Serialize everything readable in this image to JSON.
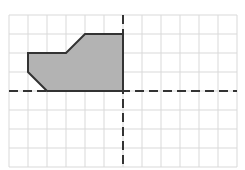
{
  "diagram": {
    "type": "coordinate-grid",
    "grid": {
      "columns": 12,
      "rows": 8,
      "cell_size": 19,
      "origin_px": [
        9,
        15
      ],
      "line_color": "#d9d9d9"
    },
    "axes": {
      "x_axis_row": 4,
      "y_axis_col": 6,
      "style": "dashed",
      "color": "#333333"
    },
    "shape": {
      "name": "shaded-polygon",
      "fill": "#b3b3b3",
      "stroke": "#333333",
      "vertices_grid": [
        [
          4,
          1
        ],
        [
          6,
          1
        ],
        [
          6,
          4
        ],
        [
          2,
          4
        ],
        [
          1,
          3
        ],
        [
          1,
          2
        ],
        [
          3,
          2
        ]
      ]
    }
  }
}
